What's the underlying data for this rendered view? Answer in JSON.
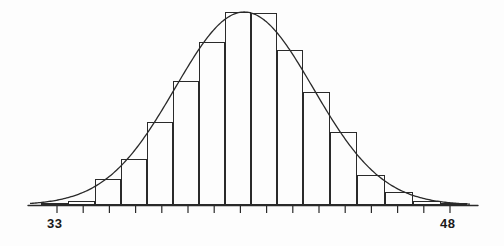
{
  "figure": {
    "title": "",
    "background": "#fdfdfd",
    "ink_color": "#2a2a2a"
  },
  "axis": {
    "left_label": "33",
    "right_label": "48",
    "baseline_y": 205,
    "x_start": 28,
    "x_end": 478,
    "tick_count": 16,
    "tick_length": 7
  },
  "chart_data": {
    "type": "bar",
    "title": "",
    "subtitle": "Histogram of data with fitted normal density curve",
    "xlabel": "",
    "ylabel": "",
    "grid": false,
    "legend": false,
    "xlim": [
      33,
      48
    ],
    "ylim": [
      0,
      100
    ],
    "axis_tick_labels": [
      "33",
      "48"
    ],
    "bin_width": 1,
    "categories": [
      33,
      34,
      35,
      36,
      37,
      38,
      39,
      40,
      41,
      42,
      43,
      44,
      45,
      46,
      47,
      48
    ],
    "bin_edges": [
      33,
      34,
      35,
      36,
      37,
      38,
      39,
      40,
      41,
      42,
      43,
      44,
      45,
      46,
      47,
      48
    ],
    "values": [
      1,
      3,
      12,
      26,
      45,
      61,
      81,
      97,
      97,
      76,
      55,
      36,
      15,
      7,
      2,
      1
    ],
    "series": [
      {
        "name": "frequency",
        "type": "bar",
        "values": [
          1,
          3,
          12,
          26,
          45,
          61,
          81,
          97,
          97,
          76,
          55,
          36,
          15,
          7,
          2,
          1
        ]
      },
      {
        "name": "normal-density-curve",
        "type": "line",
        "mean": 40.3,
        "sigma": 2.35,
        "peak_value": 100
      }
    ],
    "bars_px": [
      {
        "x": 41,
        "w": 27,
        "h": 2
      },
      {
        "x": 68,
        "w": 27,
        "h": 4
      },
      {
        "x": 95,
        "w": 26,
        "h": 26
      },
      {
        "x": 121,
        "w": 26,
        "h": 46
      },
      {
        "x": 147,
        "w": 26,
        "h": 83
      },
      {
        "x": 173,
        "w": 26,
        "h": 124
      },
      {
        "x": 199,
        "w": 26,
        "h": 163
      },
      {
        "x": 225,
        "w": 26,
        "h": 193
      },
      {
        "x": 251,
        "w": 26,
        "h": 192
      },
      {
        "x": 277,
        "w": 26,
        "h": 155
      },
      {
        "x": 303,
        "w": 27,
        "h": 113
      },
      {
        "x": 330,
        "w": 27,
        "h": 73
      },
      {
        "x": 357,
        "w": 28,
        "h": 30
      },
      {
        "x": 385,
        "w": 28,
        "h": 13
      },
      {
        "x": 413,
        "w": 28,
        "h": 4
      },
      {
        "x": 441,
        "w": 26,
        "h": 2
      }
    ],
    "curve_px": {
      "baseline_y": 205,
      "peak_x": 228,
      "peak_y": 12,
      "left_foot_x": 30,
      "right_foot_x": 470
    }
  }
}
